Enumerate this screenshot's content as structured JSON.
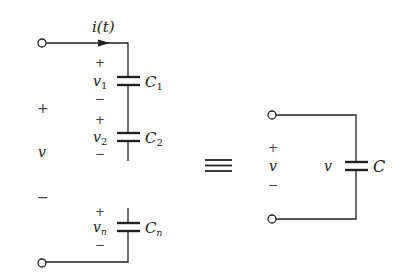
{
  "diagram": {
    "title": "",
    "left_circuit": {
      "current_label": "i(t)",
      "source_voltage": {
        "plus": "+",
        "label": "v",
        "minus": "−"
      },
      "capacitors": [
        {
          "name": "C",
          "sub": "1",
          "voltage": "v",
          "vsub": "1",
          "plus": "+",
          "minus": "−"
        },
        {
          "name": "C",
          "sub": "2",
          "voltage": "v",
          "vsub": "2",
          "plus": "+",
          "minus": "−"
        },
        {
          "name": "C",
          "sub": "n",
          "voltage": "v",
          "vsub": "n",
          "plus": "+",
          "minus": "−"
        }
      ]
    },
    "equivalence_symbol": "≡",
    "right_circuit": {
      "source_voltage": {
        "plus": "+",
        "label": "v",
        "minus": "−"
      },
      "capacitor": {
        "name": "C",
        "voltage": "v"
      }
    },
    "colors": {
      "stroke": "#222222",
      "background": "#ffffff"
    }
  }
}
